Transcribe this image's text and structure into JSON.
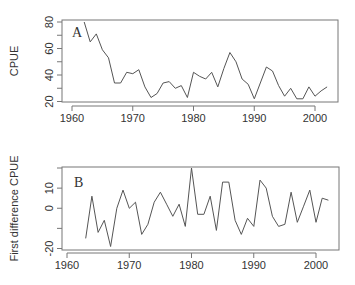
{
  "chart_data": [
    {
      "type": "line",
      "panel_label": "A",
      "title": "",
      "xlabel": "",
      "ylabel": "CPUE",
      "xlim": [
        1960,
        2002
      ],
      "ylim": [
        20,
        80
      ],
      "x_ticks": [
        1960,
        1970,
        1980,
        1990,
        2000
      ],
      "y_ticks": [
        20,
        30,
        40,
        50,
        60,
        70,
        80
      ],
      "y_tick_labels": [
        "20",
        "",
        "40",
        "",
        "60",
        "",
        "80"
      ],
      "grid": false,
      "legend": null,
      "x": [
        1962,
        1963,
        1964,
        1965,
        1966,
        1967,
        1968,
        1969,
        1970,
        1971,
        1972,
        1973,
        1974,
        1975,
        1976,
        1977,
        1978,
        1979,
        1980,
        1981,
        1982,
        1983,
        1984,
        1985,
        1986,
        1987,
        1988,
        1989,
        1990,
        1991,
        1992,
        1993,
        1994,
        1995,
        1996,
        1997,
        1998,
        1999,
        2000,
        2001,
        2002
      ],
      "values": [
        80,
        65,
        71,
        59,
        53,
        34,
        34,
        42,
        41,
        44,
        31,
        23,
        26,
        34,
        35,
        30,
        32,
        23,
        42,
        39,
        37,
        42,
        31,
        45,
        57,
        50,
        37,
        33,
        22,
        34,
        46,
        43,
        32,
        24,
        30,
        22,
        22,
        31,
        24,
        28,
        31
      ],
      "layout": {
        "box": [
          62,
          20,
          338,
          102
        ],
        "xaxis_y": 106,
        "x0px": 72,
        "x1px": 315,
        "ytop": 22,
        "ybot": 101.5,
        "label_x": 72,
        "label_y": 37,
        "ylabel_x": 18,
        "tick_label_y": 122
      }
    },
    {
      "type": "line",
      "panel_label": "B",
      "title": "",
      "xlabel": "",
      "ylabel": "First difference CPUE",
      "xlim": [
        1960,
        2002
      ],
      "ylim": [
        -20,
        20
      ],
      "x_ticks": [
        1960,
        1970,
        1980,
        1990,
        2000
      ],
      "y_ticks": [
        -20,
        -10,
        0,
        10,
        20
      ],
      "y_tick_labels": [
        "-20",
        "",
        "0",
        "10",
        ""
      ],
      "grid": false,
      "legend": null,
      "x": [
        1963,
        1964,
        1965,
        1966,
        1967,
        1968,
        1969,
        1970,
        1971,
        1972,
        1973,
        1974,
        1975,
        1976,
        1977,
        1978,
        1979,
        1980,
        1981,
        1982,
        1983,
        1984,
        1985,
        1986,
        1987,
        1988,
        1989,
        1990,
        1991,
        1992,
        1993,
        1994,
        1995,
        1996,
        1997,
        1998,
        1999,
        2000,
        2001,
        2002
      ],
      "values": [
        -15,
        6,
        -12,
        -6,
        -19,
        0,
        9,
        0,
        3,
        -13,
        -8,
        3,
        8,
        2,
        -4,
        2,
        -9,
        20,
        -3,
        -3,
        6,
        -11,
        13,
        13,
        -6,
        -13,
        -5,
        -9,
        14,
        10,
        -4,
        -9,
        -8,
        8,
        -7,
        1,
        9,
        -7,
        5,
        4
      ],
      "layout": {
        "box": [
          62,
          167,
          339,
          250
        ],
        "xaxis_y": 253,
        "x0px": 67,
        "x1px": 316,
        "ytop": 168,
        "ybot": 248.5,
        "label_x": 74,
        "label_y": 187,
        "ylabel_x": 18,
        "tick_label_y": 269
      }
    }
  ]
}
